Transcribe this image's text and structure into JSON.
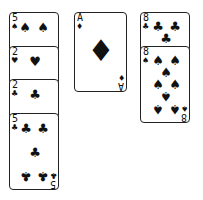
{
  "game": "Solitaire",
  "columns": [
    {
      "name": "left-tableau",
      "cards": [
        {
          "rank": "5",
          "suit": "spades",
          "glyph": "♠"
        },
        {
          "rank": "2",
          "suit": "hearts",
          "glyph": "♥"
        },
        {
          "rank": "2",
          "suit": "clubs",
          "glyph": "♣"
        },
        {
          "rank": "5",
          "suit": "clubs",
          "glyph": "♣"
        }
      ]
    },
    {
      "name": "center-pile",
      "cards": [
        {
          "rank": "A",
          "suit": "diamonds",
          "glyph": "♦"
        }
      ]
    },
    {
      "name": "right-tableau",
      "cards": [
        {
          "rank": "8",
          "suit": "clubs",
          "glyph": "♣"
        },
        {
          "rank": "8",
          "suit": "spades",
          "glyph": "♠"
        }
      ]
    }
  ]
}
